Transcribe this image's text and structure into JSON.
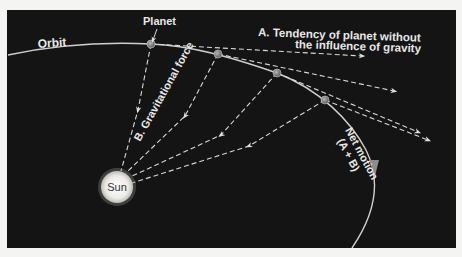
{
  "diagram": {
    "type": "orbital-motion",
    "labels": {
      "orbit": "Orbit",
      "planet": "Planet",
      "tendency_line1": "A.  Tendency of planet without",
      "tendency_line2": "the influence of gravity",
      "gravity": "B.  Gravitational force",
      "net_motion_line1": "Net motion",
      "net_motion_line2": "(A + B)",
      "sun": "Sun"
    },
    "colors": {
      "background": "#141414",
      "page": "#f4f4f2",
      "lines": "#d8d8d8",
      "sun": "#f2f2ee",
      "planet": "#8a8a8a",
      "net_motion_arrow": "#8c8c8c"
    },
    "sun": {
      "x": 117,
      "y": 187,
      "r": 16
    },
    "planets": [
      {
        "x": 151,
        "y": 44
      },
      {
        "x": 218,
        "y": 54
      },
      {
        "x": 277,
        "y": 73
      },
      {
        "x": 325,
        "y": 100
      }
    ],
    "tangent_arrow_tips": [
      {
        "x": 365,
        "y": 56
      },
      {
        "x": 397,
        "y": 92
      },
      {
        "x": 420,
        "y": 134
      },
      {
        "x": 430,
        "y": 141
      }
    ]
  }
}
